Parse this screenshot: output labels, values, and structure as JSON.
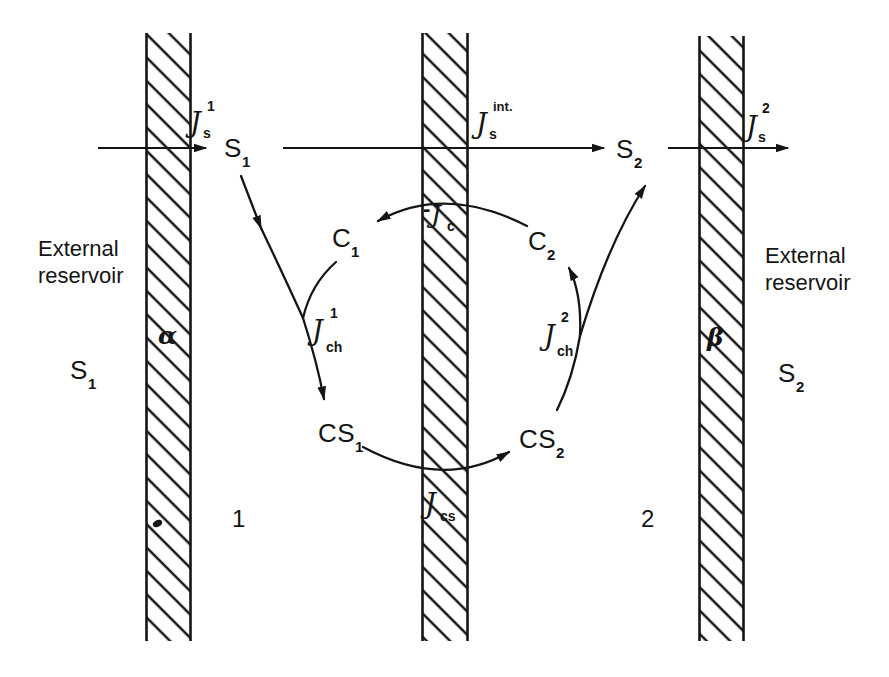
{
  "diagram": {
    "left_reservoir": {
      "title_line1": "External",
      "title_line2": "reservoir",
      "species": "S",
      "species_sub": "1"
    },
    "right_reservoir": {
      "title_line1": "External",
      "title_line2": "reservoir",
      "species": "S",
      "species_sub": "2"
    },
    "membrane_alpha": "α",
    "membrane_beta": "β",
    "compartment_1": "1",
    "compartment_2": "2",
    "flux_js1": {
      "base": "J",
      "sup": "1",
      "sub": "s"
    },
    "flux_jsint": {
      "base": "J",
      "sup": "int.",
      "sub": "s"
    },
    "flux_js2": {
      "base": "J",
      "sup": "2",
      "sub": "s"
    },
    "flux_jc": {
      "sign": "-",
      "base": "J",
      "sub": "c"
    },
    "flux_jch1": {
      "base": "J",
      "sup": "1",
      "sub": "ch"
    },
    "flux_jch2": {
      "base": "J",
      "sup": "2",
      "sub": "ch"
    },
    "flux_jcs": {
      "base": "J",
      "sub": "cs"
    },
    "species_s1": {
      "base": "S",
      "sub": "1"
    },
    "species_s2": {
      "base": "S",
      "sub": "2"
    },
    "species_c1": {
      "base": "C",
      "sub": "1"
    },
    "species_c2": {
      "base": "C",
      "sub": "2"
    },
    "species_cs1": {
      "base": "CS",
      "sub": "1"
    },
    "species_cs2": {
      "base": "CS",
      "sub": "2"
    },
    "colors": {
      "ink": "#151515",
      "background": "#ffffff"
    }
  }
}
